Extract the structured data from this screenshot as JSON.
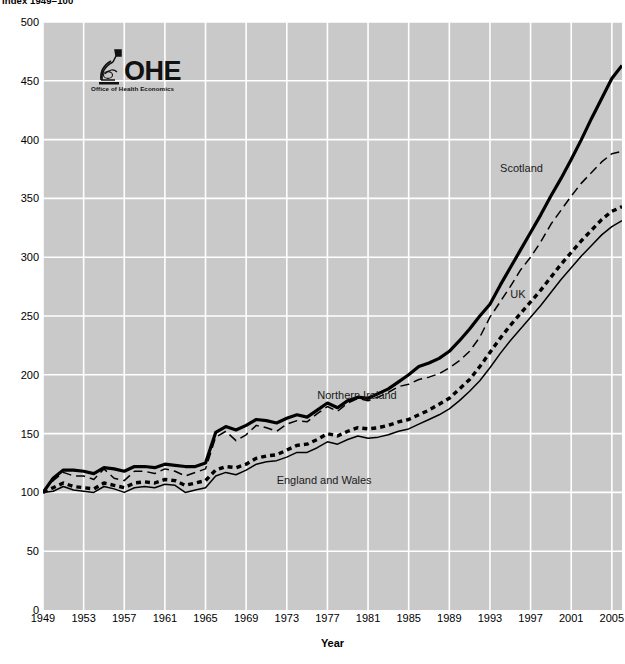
{
  "chart_title": "Index 1949=100",
  "logo": {
    "name": "ohe-logo",
    "wordmark": "OHE",
    "tagline": "Office of Health Economics",
    "mark_icon": "microscope-icon"
  },
  "axis": {
    "x_title": "Year",
    "y_title": ""
  },
  "colors": {
    "plot_background": "#c9c9c9",
    "gridline": "#ffffff",
    "series_line": "#000000",
    "page_background": "#ffffff",
    "text": "#000000"
  },
  "chart_data": {
    "type": "line",
    "title": "Index 1949=100",
    "xlabel": "Year",
    "ylabel": "",
    "xlim": [
      1949,
      2006
    ],
    "ylim": [
      0,
      500
    ],
    "ytick_labels": [
      "0",
      "50",
      "100",
      "150",
      "200",
      "250",
      "300",
      "350",
      "400",
      "450",
      "500"
    ],
    "yticks": [
      0,
      50,
      100,
      150,
      200,
      250,
      300,
      350,
      400,
      450,
      500
    ],
    "xtick_labels": [
      "1949",
      "1953",
      "1957",
      "1961",
      "1965",
      "1969",
      "1973",
      "1977",
      "1981",
      "1985",
      "1989",
      "1993",
      "1997",
      "2001",
      "2005"
    ],
    "xticks": [
      1949,
      1953,
      1957,
      1961,
      1965,
      1969,
      1973,
      1977,
      1981,
      1985,
      1989,
      1993,
      1997,
      2001,
      2005
    ],
    "grid": true,
    "legend_position": "inline-annotations",
    "x": [
      1949,
      1950,
      1951,
      1952,
      1953,
      1954,
      1955,
      1956,
      1957,
      1958,
      1959,
      1960,
      1961,
      1962,
      1963,
      1964,
      1965,
      1966,
      1967,
      1968,
      1969,
      1970,
      1971,
      1972,
      1973,
      1974,
      1975,
      1976,
      1977,
      1978,
      1979,
      1980,
      1981,
      1982,
      1983,
      1984,
      1985,
      1986,
      1987,
      1988,
      1989,
      1990,
      1991,
      1992,
      1993,
      1994,
      1995,
      1996,
      1997,
      1998,
      1999,
      2000,
      2001,
      2002,
      2003,
      2004,
      2005,
      2006
    ],
    "series": [
      {
        "name": "Scotland",
        "style": "thick-solid",
        "label_x": 1994,
        "label_y": 375,
        "values": [
          100,
          112,
          119,
          119,
          118,
          116,
          121,
          120,
          118,
          122,
          122,
          121,
          124,
          123,
          122,
          122,
          125,
          151,
          156,
          153,
          157,
          162,
          161,
          159,
          163,
          166,
          164,
          170,
          176,
          172,
          178,
          181,
          180,
          184,
          188,
          194,
          200,
          207,
          210,
          214,
          220,
          229,
          239,
          250,
          260,
          276,
          291,
          306,
          321,
          336,
          352,
          367,
          383,
          400,
          418,
          435,
          452,
          463
        ]
      },
      {
        "name": "Northern Ireland",
        "style": "dashed",
        "label_x": 1976,
        "label_y": 182,
        "values": [
          100,
          110,
          117,
          114,
          114,
          111,
          120,
          112,
          110,
          118,
          118,
          116,
          120,
          118,
          114,
          117,
          120,
          147,
          152,
          144,
          149,
          157,
          155,
          152,
          158,
          161,
          160,
          167,
          173,
          169,
          176,
          180,
          178,
          181,
          185,
          190,
          192,
          196,
          198,
          201,
          206,
          212,
          220,
          232,
          249,
          262,
          275,
          289,
          300,
          313,
          328,
          340,
          352,
          363,
          372,
          381,
          388,
          390
        ]
      },
      {
        "name": "UK",
        "style": "dotted",
        "label_x": 1995,
        "label_y": 268,
        "values": [
          100,
          104,
          108,
          105,
          104,
          103,
          108,
          106,
          104,
          108,
          109,
          108,
          111,
          110,
          106,
          108,
          110,
          119,
          122,
          121,
          124,
          129,
          131,
          132,
          136,
          140,
          141,
          145,
          150,
          148,
          152,
          155,
          154,
          155,
          157,
          160,
          162,
          166,
          170,
          175,
          180,
          188,
          196,
          207,
          219,
          231,
          242,
          252,
          262,
          272,
          283,
          294,
          304,
          314,
          323,
          332,
          339,
          343
        ]
      },
      {
        "name": "England and Wales",
        "style": "thin-solid",
        "label_x": 1972,
        "label_y": 110,
        "values": [
          100,
          101,
          105,
          102,
          101,
          100,
          105,
          103,
          100,
          104,
          105,
          104,
          107,
          106,
          100,
          102,
          104,
          114,
          117,
          115,
          119,
          124,
          126,
          127,
          130,
          134,
          134,
          138,
          143,
          141,
          145,
          148,
          146,
          147,
          149,
          152,
          154,
          158,
          162,
          166,
          171,
          178,
          186,
          195,
          206,
          218,
          229,
          239,
          249,
          259,
          270,
          281,
          291,
          301,
          310,
          319,
          326,
          331
        ]
      }
    ]
  },
  "annotations": [
    {
      "name": "scotland-label",
      "text": "Scotland"
    },
    {
      "name": "northern-ireland-label",
      "text": "Northern Ireland"
    },
    {
      "name": "uk-label",
      "text": "UK"
    },
    {
      "name": "england-and-wales-label",
      "text": "England and Wales"
    }
  ]
}
